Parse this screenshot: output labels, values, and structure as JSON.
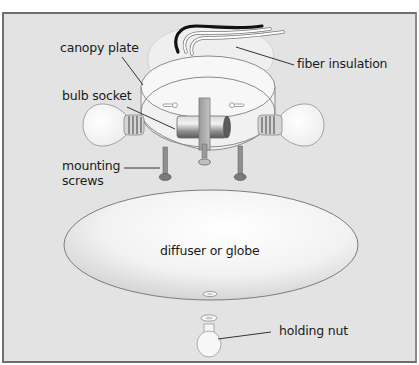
{
  "diagram": {
    "colors": {
      "background": "#e3e3e3",
      "border": "#6f6f6f",
      "part_fill": "#f4f4f4",
      "part_stroke": "#8c8c8c",
      "leader_line": "#333333",
      "text": "#1a1a1a"
    },
    "labels": {
      "canopy_plate": "canopy plate",
      "fiber_insulation": "fiber insulation",
      "bulb_socket": "bulb socket",
      "mounting_screws": "mounting\nscrews",
      "diffuser": "diffuser or globe",
      "holding_nut": "holding nut"
    },
    "parts": [
      {
        "id": "wires",
        "name": "electrical wires",
        "colors": [
          "#111111",
          "#ffffff",
          "#ffffff"
        ]
      },
      {
        "id": "canopy_plate",
        "name": "canopy plate"
      },
      {
        "id": "fiber_insulation",
        "name": "fiber insulation"
      },
      {
        "id": "bulb_left",
        "name": "light bulb"
      },
      {
        "id": "bulb_right",
        "name": "light bulb"
      },
      {
        "id": "socket_bar",
        "name": "bulb socket"
      },
      {
        "id": "screw_left",
        "name": "mounting screw"
      },
      {
        "id": "screw_right",
        "name": "mounting screw"
      },
      {
        "id": "center_stud",
        "name": "center stud"
      },
      {
        "id": "diffuser",
        "name": "diffuser or globe"
      },
      {
        "id": "washer",
        "name": "washer"
      },
      {
        "id": "holding_nut",
        "name": "holding nut"
      }
    ]
  }
}
